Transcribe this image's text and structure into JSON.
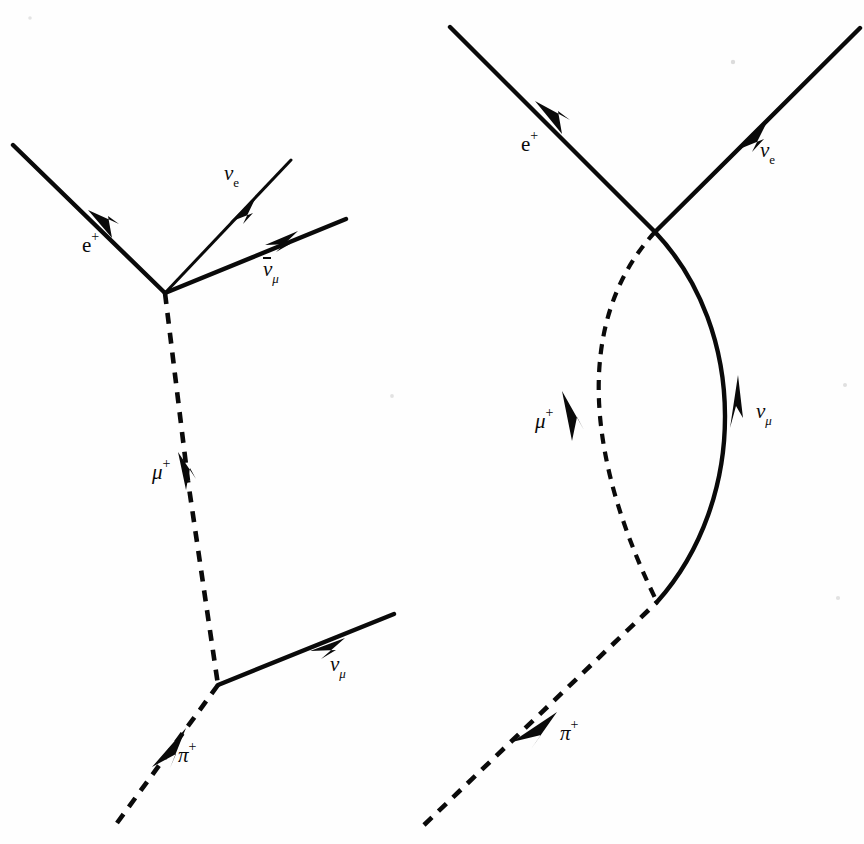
{
  "figure": {
    "background_color": "#fefefe",
    "ink_color": "#0a0a0a",
    "width": 864,
    "height": 844
  },
  "diagrams": [
    {
      "id": "left-diagram",
      "name": "straight-line-decay-diagram",
      "description": "pi+ decays to mu+ and nu_mu; mu+ decays to e+, nu_e and anti-nu_mu",
      "vertices": [
        {
          "name": "upper-vertex",
          "x": 165,
          "y": 293
        },
        {
          "name": "lower-vertex",
          "x": 218,
          "y": 685
        }
      ],
      "particles": [
        {
          "name": "positron-line",
          "label": "e",
          "superscript": "+",
          "subscript": "",
          "overbar": false,
          "style": "solid",
          "thickness": "thick",
          "label_x": 82,
          "label_y": 235,
          "arrow_dir": "down-right",
          "from": [
            13,
            145
          ],
          "to": [
            165,
            293
          ]
        },
        {
          "name": "electron-neutrino-line",
          "label": "ν",
          "superscript": "",
          "subscript": "e",
          "sub_roman": true,
          "overbar": false,
          "style": "solid",
          "thickness": "thin",
          "label_x": 224,
          "label_y": 163,
          "arrow_dir": "up-right",
          "from": [
            165,
            293
          ],
          "to": [
            291,
            160
          ]
        },
        {
          "name": "anti-muon-neutrino-line",
          "label": "ν",
          "superscript": "",
          "subscript": "μ",
          "sub_roman": false,
          "overbar": true,
          "style": "solid",
          "thickness": "thick",
          "label_x": 263,
          "label_y": 259,
          "arrow_dir": "up-right",
          "from": [
            165,
            293
          ],
          "to": [
            346,
            219
          ]
        },
        {
          "name": "antimuon-line",
          "label": "μ",
          "superscript": "+",
          "subscript": "",
          "overbar": false,
          "style": "dashed",
          "thickness": "thick",
          "label_x": 152,
          "label_y": 462,
          "arrow_dir": "down",
          "from": [
            165,
            293
          ],
          "to": [
            218,
            685
          ]
        },
        {
          "name": "muon-neutrino-line",
          "label": "ν",
          "superscript": "",
          "subscript": "μ",
          "sub_roman": false,
          "overbar": false,
          "style": "solid",
          "thickness": "thick",
          "label_x": 330,
          "label_y": 654,
          "arrow_dir": "up-right",
          "from": [
            218,
            685
          ],
          "to": [
            394,
            614
          ]
        },
        {
          "name": "pion-line",
          "label": "π",
          "superscript": "+",
          "subscript": "",
          "overbar": false,
          "style": "dashed",
          "thickness": "thick",
          "label_x": 178,
          "label_y": 745,
          "arrow_dir": "up-right",
          "from": [
            117,
            823
          ],
          "to": [
            218,
            685
          ]
        }
      ]
    },
    {
      "id": "right-diagram",
      "name": "curved-line-decay-diagram",
      "description": "same decay chain drawn with curved mu+ and nu_mu lines forming a lens shape",
      "vertices": [
        {
          "name": "upper-vertex",
          "x": 655,
          "y": 232
        },
        {
          "name": "lower-vertex",
          "x": 657,
          "y": 602
        }
      ],
      "particles": [
        {
          "name": "positron-line",
          "label": "e",
          "superscript": "+",
          "subscript": "",
          "overbar": false,
          "style": "solid",
          "thickness": "thick",
          "label_x": 521,
          "label_y": 134,
          "arrow_dir": "down-right",
          "from": [
            450,
            27
          ],
          "to": [
            655,
            232
          ]
        },
        {
          "name": "electron-neutrino-line",
          "label": "ν",
          "superscript": "",
          "subscript": "e",
          "sub_roman": true,
          "overbar": false,
          "style": "solid",
          "thickness": "thick",
          "label_x": 760,
          "label_y": 140,
          "arrow_dir": "up-right",
          "from": [
            655,
            232
          ],
          "to": [
            860,
            28
          ]
        },
        {
          "name": "antimuon-curve",
          "label": "μ",
          "superscript": "+",
          "subscript": "",
          "overbar": false,
          "style": "dashed",
          "thickness": "thick",
          "label_x": 535,
          "label_y": 411,
          "arrow_dir": "down",
          "from": [
            655,
            232
          ],
          "to": [
            657,
            602
          ],
          "bow": "left"
        },
        {
          "name": "muon-neutrino-curve",
          "label": "ν",
          "superscript": "",
          "subscript": "μ",
          "sub_roman": false,
          "overbar": false,
          "style": "solid",
          "thickness": "thick",
          "label_x": 756,
          "label_y": 401,
          "arrow_dir": "up",
          "from": [
            657,
            602
          ],
          "to": [
            655,
            232
          ],
          "bow": "right"
        },
        {
          "name": "pion-line",
          "label": "π",
          "superscript": "+",
          "subscript": "",
          "overbar": false,
          "style": "dashed",
          "thickness": "thick",
          "label_x": 560,
          "label_y": 723,
          "arrow_dir": "up-right",
          "from": [
            424,
            825
          ],
          "to": [
            657,
            602
          ]
        }
      ]
    }
  ]
}
